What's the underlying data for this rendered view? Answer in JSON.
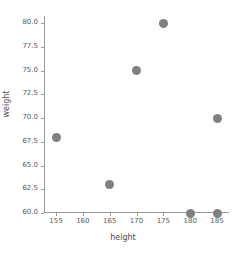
{
  "chart_data": {
    "type": "scatter",
    "title": "",
    "xlabel": "height",
    "ylabel": "weight",
    "x": [
      155,
      165,
      170,
      175,
      180,
      185,
      185
    ],
    "y": [
      68,
      63,
      75,
      80,
      60,
      60,
      70
    ],
    "points": [
      {
        "x": 155,
        "y": 68
      },
      {
        "x": 165,
        "y": 63
      },
      {
        "x": 170,
        "y": 75
      },
      {
        "x": 175,
        "y": 80
      },
      {
        "x": 180,
        "y": 60
      },
      {
        "x": 185,
        "y": 60
      },
      {
        "x": 185,
        "y": 70
      }
    ],
    "xlim": [
      152.5,
      187.5
    ],
    "ylim": [
      58.5,
      81.5
    ],
    "xticks": [
      155,
      160,
      165,
      170,
      175,
      180,
      185
    ],
    "xtick_labels": [
      "155",
      "160",
      "165",
      "170",
      "175",
      "180",
      "185"
    ],
    "yticks": [
      60.0,
      62.5,
      65.0,
      67.5,
      70.0,
      72.5,
      75.0,
      77.5,
      80.0
    ],
    "ytick_labels": [
      "60.0",
      "62.5",
      "65.0",
      "67.5",
      "70.0",
      "72.5",
      "75.0",
      "77.5",
      "80.0"
    ],
    "grid": false,
    "legend": false,
    "marker_color": "#808080",
    "axis_color": "#9a9a9a",
    "background": "#ffffff"
  }
}
